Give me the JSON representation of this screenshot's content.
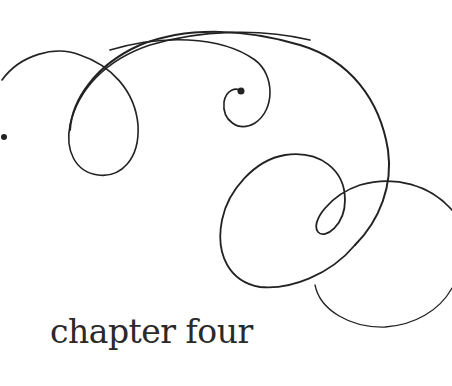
{
  "page": {
    "title": "chapter four",
    "ink_color": "#222222",
    "background": "#ffffff"
  }
}
